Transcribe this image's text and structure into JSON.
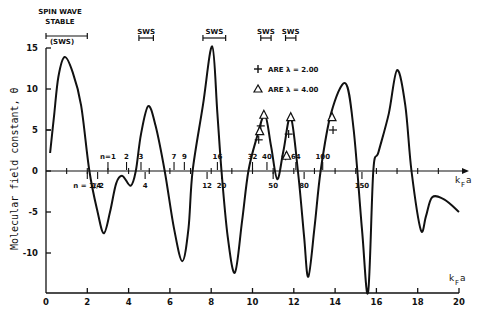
{
  "chart_data": {
    "type": "line",
    "title": "",
    "xlabel": "k_F a",
    "ylabel": "Molecular field constant, θ",
    "xlim": [
      0,
      20
    ],
    "ylim": [
      -15,
      15
    ],
    "x_ticks": [
      0,
      2,
      4,
      6,
      8,
      10,
      12,
      14,
      16,
      18,
      20
    ],
    "y_ticks": [
      15,
      10,
      5,
      0,
      -5,
      -10
    ],
    "grid": false,
    "legend_position": "upper-center",
    "legend": [
      {
        "symbol": "+",
        "label": "ARE λ = 2.00"
      },
      {
        "symbol": "△",
        "label": "ARE λ = 4.00"
      }
    ],
    "series": [
      {
        "name": "θ(k_F a)",
        "x": [
          0.2,
          0.4,
          0.6,
          0.9,
          1.3,
          1.7,
          2.1,
          2.5,
          2.8,
          3.1,
          3.4,
          3.7,
          4.1,
          4.35,
          4.6,
          4.95,
          5.3,
          5.75,
          6.2,
          6.6,
          6.9,
          7.1,
          7.6,
          8.05,
          8.3,
          8.5,
          8.8,
          9.15,
          9.5,
          9.8,
          10.2,
          10.6,
          10.9,
          11.2,
          11.5,
          11.85,
          12.2,
          12.5,
          12.7,
          13.0,
          13.3,
          13.8,
          14.5,
          14.9,
          15.3,
          15.6,
          15.85,
          16.1,
          16.6,
          17.0,
          17.4,
          17.7,
          18.15,
          18.4,
          18.7,
          19.3,
          20.0
        ],
        "y": [
          2.2,
          7.0,
          11.5,
          13.9,
          12.0,
          8.0,
          0.0,
          -5.0,
          -7.6,
          -5.0,
          -1.5,
          -0.6,
          -1.8,
          0.0,
          4.5,
          7.9,
          5.6,
          0.0,
          -7.0,
          -11.0,
          -7.0,
          0.0,
          8.0,
          15.2,
          7.0,
          0.0,
          -8.0,
          -12.4,
          -6.0,
          0.0,
          4.0,
          6.8,
          3.0,
          -1.0,
          2.5,
          6.6,
          0.0,
          -8.0,
          -12.9,
          -7.0,
          0.0,
          7.0,
          10.7,
          5.0,
          -7.0,
          -14.8,
          0.0,
          2.3,
          7.0,
          12.3,
          8.0,
          0.0,
          -7.2,
          -5.5,
          -3.2,
          -3.5,
          -5.0
        ]
      },
      {
        "name": "λ = 2.00 (+)",
        "x": [
          10.3,
          10.4,
          11.6,
          11.75,
          13.9
        ],
        "y": [
          3.8,
          5.5,
          1.8,
          4.5,
          5.0
        ]
      },
      {
        "name": "λ = 4.00 (△)",
        "x": [
          10.35,
          10.55,
          11.65,
          11.85,
          13.85
        ],
        "y": [
          4.8,
          6.8,
          1.8,
          6.5,
          6.5
        ]
      }
    ],
    "annotations": {
      "sws_label_main": [
        "SPIN WAVE",
        "STABLE",
        "(SWS)"
      ],
      "sws_regions": [
        {
          "label": "(SWS)",
          "x_range": [
            0.0,
            2.0
          ]
        },
        {
          "label": "SWS",
          "x_range": [
            4.5,
            5.2
          ]
        },
        {
          "label": "SWS",
          "x_range": [
            7.6,
            8.7
          ]
        },
        {
          "label": "SWS",
          "x_range": [
            10.4,
            10.9
          ]
        },
        {
          "label": "SWS",
          "x_range": [
            11.6,
            12.1
          ]
        }
      ],
      "n_markers_above": [
        {
          "label": "n=1",
          "x": 3.0
        },
        {
          "label": "2",
          "x": 3.9
        },
        {
          "label": "3",
          "x": 4.6
        },
        {
          "label": "7",
          "x": 6.2
        },
        {
          "label": "9",
          "x": 6.7
        },
        {
          "label": "16",
          "x": 8.3
        },
        {
          "label": "32",
          "x": 10.0
        },
        {
          "label": "40",
          "x": 10.7
        },
        {
          "label": "64",
          "x": 12.1
        },
        {
          "label": "100",
          "x": 13.4
        }
      ],
      "n_markers_below": [
        {
          "label": "n = 1/4",
          "x": 2.0
        },
        {
          "label": "1/2",
          "x": 2.5
        },
        {
          "label": "4",
          "x": 4.8
        },
        {
          "label": "12",
          "x": 7.8
        },
        {
          "label": "20",
          "x": 8.5
        },
        {
          "label": "50",
          "x": 11.0
        },
        {
          "label": "80",
          "x": 12.5
        },
        {
          "label": "150",
          "x": 15.3
        }
      ]
    }
  },
  "labels": {
    "sws_main_line1": "SPIN WAVE",
    "sws_main_line2": "STABLE",
    "sws_main_line3": "(SWS)",
    "sws": "SWS",
    "legend_plus": "ARE λ = 2.00",
    "legend_tri": "ARE λ = 4.00",
    "ylabel": "Molecular field constant, θ",
    "xlabel_k": "k",
    "xlabel_sub": "F",
    "xlabel_a": "a"
  }
}
